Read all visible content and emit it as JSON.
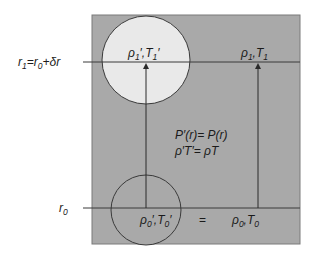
{
  "diagram": {
    "colors": {
      "box_fill": "#a9a9a9",
      "upper_parcel_fill": "#e9e9e9",
      "lower_parcel_fill": "#a9a9a9",
      "line": "#3a3a3a",
      "text": "#1a1a1a"
    },
    "levels": {
      "upper": {
        "label": "r",
        "label_sub": "1",
        "label_rest": "=r",
        "label_rest_sub": "0",
        "label_tail": "+δr"
      },
      "lower": {
        "label": "r",
        "label_sub": "0"
      }
    },
    "upper_parcel": {
      "rho": "ρ",
      "rho_sub": "1",
      "rho_prime": "′,",
      "T": "T",
      "T_sub": "1",
      "T_prime": "′"
    },
    "upper_env": {
      "rho": "ρ",
      "rho_sub": "1",
      "sep": ",",
      "T": "T",
      "T_sub": "1"
    },
    "lower_parcel": {
      "rho": "ρ",
      "rho_sub": "0",
      "rho_prime": "′,",
      "T": "T",
      "T_sub": "0",
      "T_prime": "′"
    },
    "lower_env": {
      "rho": "ρ",
      "rho_sub": "0",
      "sep": ",",
      "T": "T",
      "T_sub": "0"
    },
    "equals_sign": "=",
    "relations": [
      "P′(r)= P(r)",
      "ρ′T′= ρT"
    ]
  }
}
